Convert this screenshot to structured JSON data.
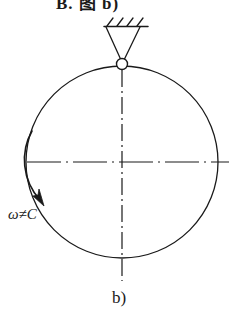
{
  "figure": {
    "top_text": "B. 图 b)",
    "caption": "b)",
    "omega_label": "ω≠C",
    "background_color": "#ffffff",
    "line_color": "#1a1a1a",
    "stroke_width": 1.2,
    "disk": {
      "name": "circular-disk",
      "center_x": 122,
      "center_y": 162,
      "radius": 96
    },
    "pivot": {
      "name": "pin-joint",
      "center_x": 122,
      "center_y": 64,
      "radius": 5.5
    },
    "support": {
      "name": "pinned-support",
      "ground_line_y": 26,
      "ground_line_x1": 104,
      "ground_line_x2": 148,
      "hatch_count": 4,
      "triangle_apex_x": 122,
      "triangle_apex_y": 60
    },
    "centerlines": {
      "style": "dash-dot",
      "horizontal_y": 162,
      "horizontal_x1": 27,
      "horizontal_x2": 229,
      "vertical_x": 122,
      "vertical_y1": 70,
      "vertical_y2": 281
    },
    "rotation_arrow": {
      "name": "rotation-direction-arrow",
      "direction": "clockwise-downward",
      "start_x": 32,
      "start_y": 131,
      "end_x": 43,
      "end_y": 203
    }
  }
}
